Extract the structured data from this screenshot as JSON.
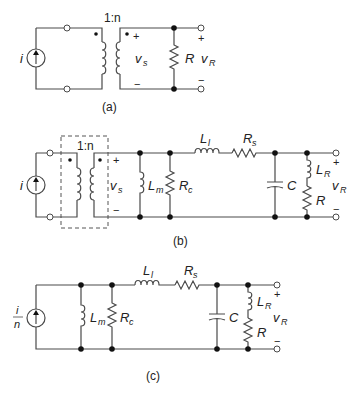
{
  "figure": {
    "panels": [
      {
        "id": "a",
        "caption": "(a)",
        "source_label": "i",
        "turns_ratio": "1:n",
        "secondary_voltage": {
          "main": "v",
          "sub": "s"
        },
        "plus": "+",
        "minus": "−",
        "load_label": "R",
        "output_voltage": {
          "main": "v",
          "sub": "R"
        },
        "out_plus": "+",
        "out_minus": "−"
      },
      {
        "id": "b",
        "caption": "(b)",
        "source_label": "i",
        "turns_ratio": "1:n",
        "secondary_voltage": {
          "main": "v",
          "sub": "s"
        },
        "plus": "+",
        "minus": "−",
        "magnetizing": {
          "main": "L",
          "sub": "m"
        },
        "core_loss": {
          "main": "R",
          "sub": "c"
        },
        "leakage": {
          "main": "L",
          "sub": "l"
        },
        "series_r": {
          "main": "R",
          "sub": "s"
        },
        "capacitor": "C",
        "load_inductance": {
          "main": "L",
          "sub": "R"
        },
        "load_label": "R",
        "output_voltage": {
          "main": "v",
          "sub": "R"
        },
        "out_plus": "+",
        "out_minus": "−"
      },
      {
        "id": "c",
        "caption": "(c)",
        "source_label": {
          "num": "i",
          "den": "n"
        },
        "magnetizing": {
          "main": "L",
          "sub": "m"
        },
        "core_loss": {
          "main": "R",
          "sub": "c"
        },
        "leakage": {
          "main": "L",
          "sub": "l"
        },
        "series_r": {
          "main": "R",
          "sub": "s"
        },
        "capacitor": "C",
        "load_inductance": {
          "main": "L",
          "sub": "R"
        },
        "load_label": "R",
        "output_voltage": {
          "main": "v",
          "sub": "R"
        },
        "out_plus": "+",
        "out_minus": "−"
      }
    ]
  }
}
